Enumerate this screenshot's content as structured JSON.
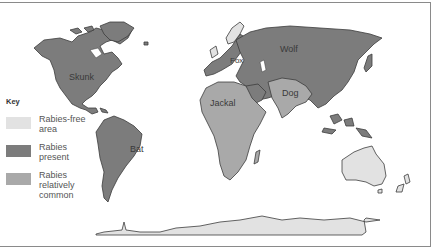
{
  "map": {
    "title": "World distribution of rabies",
    "colors": {
      "rabies_free": "#e2e2e2",
      "rabies_present": "#7c7c7c",
      "rabies_relatively_common": "#a9a9a9",
      "outline": "#3c3c3c",
      "frame": "#8a8a8a"
    },
    "region_labels": {
      "north_america": "Skunk",
      "south_america": "Bat",
      "europe": "Fox",
      "asia": "Wolf",
      "africa": "Jackal",
      "south_asia": "Dog"
    }
  },
  "legend": {
    "title": "Key",
    "items": [
      {
        "label_line1": "Rabies-free",
        "label_line2": "area",
        "label_line3": "",
        "color": "#e2e2e2"
      },
      {
        "label_line1": "Rabies",
        "label_line2": "present",
        "label_line3": "",
        "color": "#7c7c7c"
      },
      {
        "label_line1": "Rabies",
        "label_line2": "relatively",
        "label_line3": "common",
        "color": "#a9a9a9"
      }
    ]
  }
}
